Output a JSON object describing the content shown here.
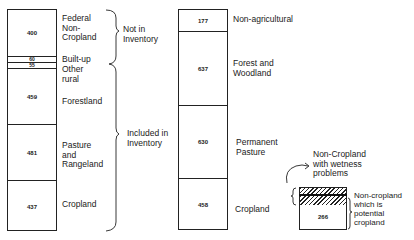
{
  "left_column": {
    "segments": [
      {
        "value": "400",
        "label": "Federal\nNon-\nCropland"
      },
      {
        "value": "60",
        "label": "Built-up"
      },
      {
        "value": "55",
        "label": "Other\nrural"
      },
      {
        "value": "459",
        "label": "Forestland"
      },
      {
        "value": "481",
        "label": "Pasture\nand\nRangeland"
      },
      {
        "value": "437",
        "label": "Cropland"
      }
    ],
    "braces": [
      {
        "label": "Not in\nInventory"
      },
      {
        "label": "Included in\nInventory"
      }
    ]
  },
  "right_column": {
    "segments": [
      {
        "value": "177",
        "label": "Non-agricultural"
      },
      {
        "value": "637",
        "label": "Forest and\nWoodland"
      },
      {
        "value": "630",
        "label": "Permanent\nPasture"
      },
      {
        "value": "458",
        "label": "Cropland"
      }
    ]
  },
  "inset": {
    "value": "266",
    "wetness_label": "Non-Cropland\nwith wetness\nproblems",
    "potential_label": "Non-cropland\nwhich is\npotential\ncropland"
  }
}
